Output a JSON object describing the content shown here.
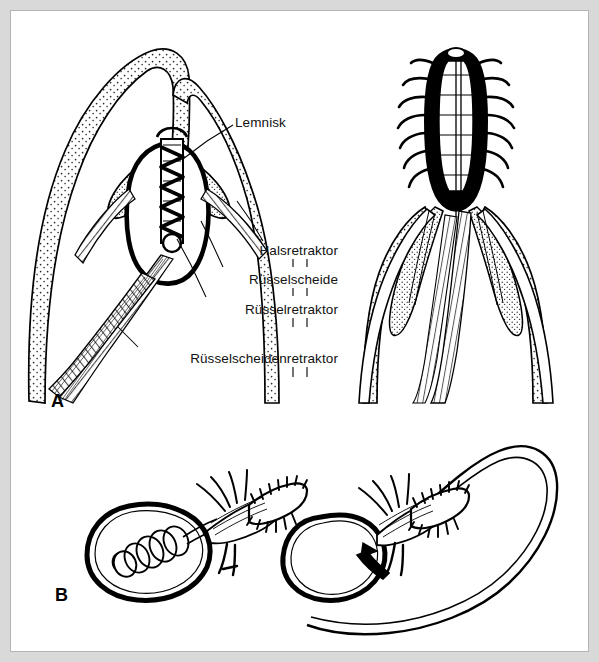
{
  "figure": {
    "kind": "scientific-line-drawing",
    "background_color": "#d9d9d9",
    "plate_background": "#ffffff",
    "frame_color": "#b4b4b4",
    "ink_color": "#000000"
  },
  "panels": [
    {
      "id": "A",
      "letter": "A",
      "x": 46,
      "y": 390
    },
    {
      "id": "B",
      "letter": "B",
      "x": 50,
      "y": 584
    }
  ],
  "labels": [
    {
      "id": "lemnisk",
      "text": "Lemnisk",
      "x": 224,
      "y": 113,
      "align": "left",
      "leader": [
        [
          222,
          122
        ],
        [
          196,
          136
        ],
        [
          170,
          152
        ]
      ]
    },
    {
      "id": "halsretraktor",
      "text": "Halsretraktor",
      "x": 327,
      "y": 241,
      "align": "right",
      "leader": [
        [
          252,
          236
        ],
        [
          238,
          215
        ],
        [
          225,
          192
        ]
      ]
    },
    {
      "id": "ruesselscheide",
      "text": "Rüsselscheide",
      "x": 327,
      "y": 269,
      "align": "right",
      "leader": [
        [
          213,
          262
        ],
        [
          200,
          236
        ],
        [
          189,
          212
        ]
      ]
    },
    {
      "id": "ruesselretraktor",
      "text": "Rüsselretraktor",
      "x": 327,
      "y": 299,
      "align": "right",
      "leader": [
        [
          196,
          292
        ],
        [
          180,
          262
        ],
        [
          166,
          228
        ]
      ]
    },
    {
      "id": "ruesselscheidenretraktor",
      "text": "Rüsselscheidenretraktor",
      "x": 327,
      "y": 348,
      "align": "right",
      "leader": [
        [
          128,
          341
        ],
        [
          118,
          330
        ],
        [
          108,
          318
        ]
      ]
    }
  ],
  "drawings": {
    "panel_a_left": {
      "caption": "Proboscis fully invaginated inside the proboscis receptacle",
      "features": [
        "body-wall-stippled",
        "lemnisci",
        "inverted-proboscis",
        "neck-retractor",
        "proboscis-receptacle",
        "proboscis-retractor",
        "receptacle-retractor"
      ]
    },
    "panel_a_right": {
      "caption": "Proboscis fully everted with hooks exposed",
      "features": [
        "everted-proboscis",
        "hooks",
        "lemnisci",
        "body-wall-stippled",
        "retractor-muscles"
      ]
    },
    "panel_b_left": {
      "caption": "Proboscis retracted, receptacle coiled",
      "features": [
        "body-sac",
        "coiled-receptacle",
        "spined-proboscis"
      ]
    },
    "panel_b_right": {
      "caption": "Proboscis everted, receptacle extended into long tube",
      "features": [
        "body-sac",
        "extended-tube",
        "spined-proboscis"
      ]
    }
  }
}
